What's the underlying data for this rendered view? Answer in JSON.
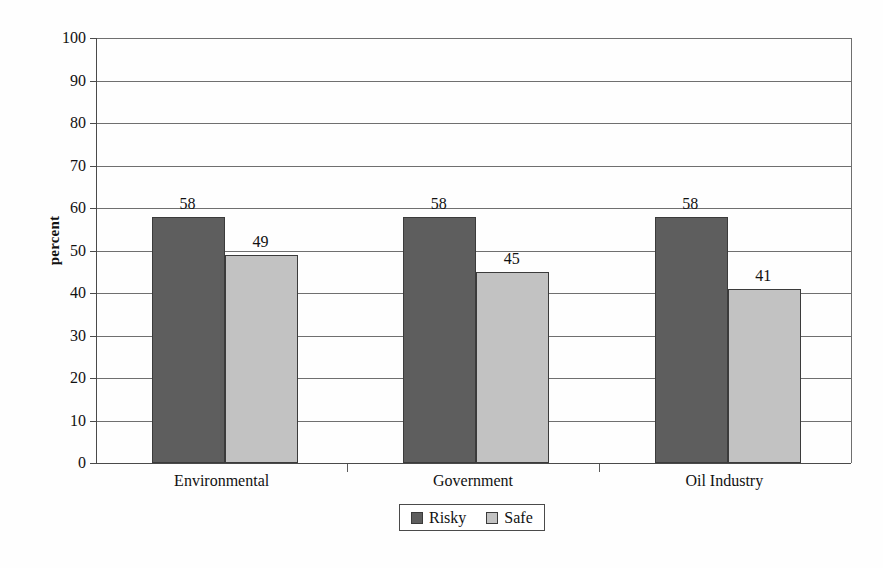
{
  "chart_data": {
    "type": "bar",
    "title": "",
    "xlabel": "",
    "ylabel": "percent",
    "ylim": [
      0,
      100
    ],
    "ytick_step": 10,
    "yticks": [
      100,
      90,
      80,
      70,
      60,
      50,
      40,
      30,
      20,
      10,
      0
    ],
    "grid": true,
    "categories": [
      "Environmental",
      "Government",
      "Oil Industry"
    ],
    "legend_position": "bottom-center",
    "series": [
      {
        "name": "Risky",
        "color": "#5e5e5e",
        "values": [
          58,
          58,
          58
        ]
      },
      {
        "name": "Safe",
        "color": "#c2c2c2",
        "values": [
          49,
          45,
          41
        ]
      }
    ],
    "data_labels": [
      {
        "category": "Environmental",
        "series": "Risky",
        "value": "58"
      },
      {
        "category": "Environmental",
        "series": "Safe",
        "value": "49"
      },
      {
        "category": "Government",
        "series": "Risky",
        "value": "58"
      },
      {
        "category": "Government",
        "series": "Safe",
        "value": "45"
      },
      {
        "category": "Oil Industry",
        "series": "Risky",
        "value": "58"
      },
      {
        "category": "Oil Industry",
        "series": "Safe",
        "value": "41"
      }
    ]
  },
  "axes": {
    "y_title": "percent",
    "y_tick_labels": [
      "100",
      "90",
      "80",
      "70",
      "60",
      "50",
      "40",
      "30",
      "20",
      "10",
      "0"
    ],
    "x_tick_labels": [
      "Environmental",
      "Government",
      "Oil Industry"
    ]
  },
  "legend": {
    "items": [
      {
        "label": "Risky",
        "swatch": "#5e5e5e"
      },
      {
        "label": "Safe",
        "swatch": "#c2c2c2"
      }
    ]
  },
  "colors": {
    "risky": "#5e5e5e",
    "safe": "#c2c2c2",
    "axis": "#4a4a4a",
    "gridline": "#6f6f6f",
    "background": "#ffffff"
  }
}
